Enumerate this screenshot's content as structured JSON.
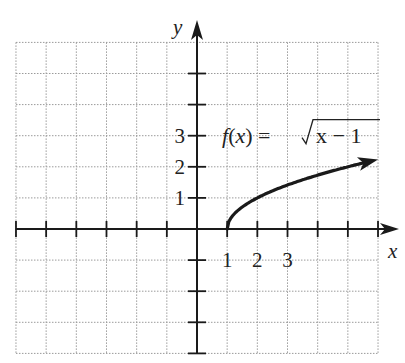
{
  "chart_data": {
    "type": "line",
    "title": "",
    "xlabel": "x",
    "ylabel": "y",
    "xlim": [
      -6,
      6
    ],
    "ylim": [
      -4,
      6
    ],
    "grid": true,
    "x_ticks": [
      -6,
      -5,
      -4,
      -3,
      -2,
      -1,
      1,
      2,
      3,
      4,
      5,
      6
    ],
    "y_ticks": [
      -4,
      -3,
      -2,
      -1,
      1,
      2,
      3,
      4,
      5
    ],
    "x_tick_labels": [
      {
        "value": 1,
        "label": "1"
      },
      {
        "value": 2,
        "label": "2"
      },
      {
        "value": 3,
        "label": "3"
      }
    ],
    "y_tick_labels": [
      {
        "value": 1,
        "label": "1"
      },
      {
        "value": 2,
        "label": "2"
      },
      {
        "value": 3,
        "label": "3"
      }
    ],
    "series": [
      {
        "name": "f(x) = √(x − 1)",
        "function": "sqrt(x-1)",
        "domain": [
          1,
          6
        ],
        "arrow_end": true,
        "x": [
          1,
          1.25,
          1.5,
          2,
          2.5,
          3,
          3.5,
          4,
          4.5,
          5,
          5.5,
          6
        ],
        "y": [
          0,
          0.5,
          0.71,
          1,
          1.22,
          1.41,
          1.58,
          1.73,
          1.87,
          2,
          2.12,
          2.24
        ]
      }
    ],
    "annotations": [
      {
        "text_prefix": "f(x) = ",
        "radicand": "x − 1",
        "anchor": {
          "x": 1,
          "y": 3
        }
      }
    ]
  }
}
